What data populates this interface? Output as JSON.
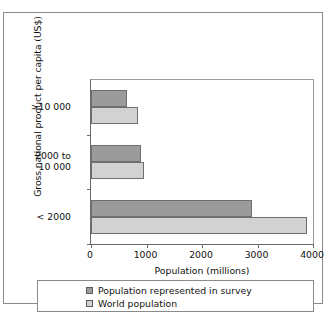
{
  "chart_data": {
    "type": "bar",
    "orientation": "horizontal",
    "title": "",
    "xlabel": "Population (millions)",
    "ylabel": "Gross national product per capita (US$)",
    "categories": [
      ">10 000",
      "2000 to\n10 000",
      "< 2000"
    ],
    "series": [
      {
        "name": "Population represented in survey",
        "color": "#9b9b9b",
        "values": [
          650,
          900,
          2900
        ]
      },
      {
        "name": "World population",
        "color": "#d2d2d2",
        "values": [
          850,
          950,
          3900
        ]
      }
    ],
    "xlim": [
      0,
      4000
    ],
    "xticks": [
      0,
      1000,
      2000,
      3000,
      4000
    ],
    "xtick_labels": [
      "0",
      "1000",
      "2000",
      "3000",
      "4000"
    ],
    "grid": false,
    "legend_position": "bottom"
  },
  "axes": {
    "y_title": "Gross national product per capita (US$)",
    "x_title": "Population (millions)"
  },
  "legend": {
    "items": [
      {
        "label": "Population represented in survey",
        "swatch": "series-survey"
      },
      {
        "label": "World population",
        "swatch": "series-world"
      }
    ]
  }
}
